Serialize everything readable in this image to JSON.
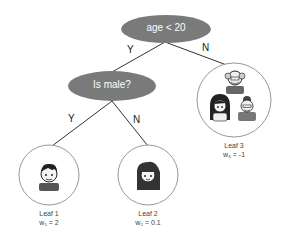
{
  "tree": {
    "root": {
      "label": "age < 20",
      "yes_label": "Y",
      "no_label": "N"
    },
    "internal": {
      "label": "Is male?",
      "yes_label": "Y",
      "no_label": "N"
    },
    "leaves": [
      {
        "name": "Leaf 1",
        "weight": "w₁ = 2",
        "people": [
          "boy"
        ]
      },
      {
        "name": "Leaf 2",
        "weight": "w₂ = 0.1",
        "people": [
          "girl"
        ]
      },
      {
        "name": "Leaf 3",
        "weight": "w₃ = -1",
        "people": [
          "grandfather",
          "woman",
          "grandmother"
        ]
      }
    ]
  },
  "colors": {
    "node_fill": "#7a7a7a",
    "edge": "#333333",
    "leaf_border": "#999999"
  }
}
